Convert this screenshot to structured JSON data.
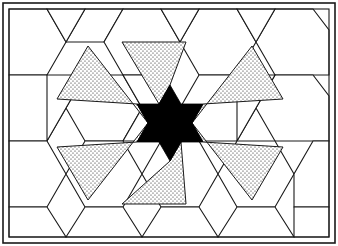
{
  "figure": {
    "kind": "line-drawing",
    "width": 338,
    "height": 246
  },
  "colors": {
    "background": "#ffffff",
    "line": "#1a1a1a",
    "core_fill": "#000000",
    "stipple_fill": "#ffffff",
    "stipple_dot": "#1a1a1a"
  },
  "frame": {
    "outer": {
      "x": 3,
      "y": 3,
      "width": 332,
      "height": 240
    },
    "inner": {
      "x": 9,
      "y": 9,
      "width": 320,
      "height": 228
    }
  },
  "geometry": {
    "center": {
      "x": 170,
      "y": 123
    },
    "core_star_points": 6,
    "core_outer_radius": 38,
    "core_inner_radius": 21,
    "ray_count": 6,
    "ray_tip_radius": 86,
    "grid": {
      "type": "hexagon-rhombus-tessellation",
      "hex_radius": 38,
      "angle_degrees": 60
    }
  },
  "elements": {
    "outer_frame": "outer-frame",
    "inner_frame": "inner-frame",
    "background_tiles": "hexagon-rhombus-tiling",
    "core_star": "black-hexagram",
    "rays": "stippled-star-points"
  },
  "core_star": {
    "points": "170,85 181,104 203,104 192,123 203,142 181,142 170,161 159,142 137,142 148,123 137,104 159,104"
  },
  "rays": [
    {
      "name": "ray-up",
      "points": "170,85 159,104 122,42 186,42"
    },
    {
      "name": "ray-upper-right",
      "points": "203,104 192,123 252,46 283,99"
    },
    {
      "name": "ray-lower-right",
      "points": "192,123 203,142 283,147 252,200"
    },
    {
      "name": "ray-down",
      "points": "170,161 181,142 186,204 122,204"
    },
    {
      "name": "ray-lower-left",
      "points": "137,142 148,123 88,200 57,147"
    },
    {
      "name": "ray-upper-left",
      "points": "148,123 137,104 57,99 88,46"
    }
  ],
  "tiles": [
    {
      "name": "hex-r0-c0",
      "points": "9,9 47,9 66,42 47,75 9,75"
    },
    {
      "name": "hex-r0-c1",
      "points": "66,42 104,42 123,9 85,9"
    },
    {
      "name": "hex-r0-c2",
      "points": "104,42 123,9 161,9 180,42 161,75 123,75"
    },
    {
      "name": "hex-r0-c3",
      "points": "180,42 199,9 237,9 256,42 237,75 199,75"
    },
    {
      "name": "hex-r0-c4",
      "points": "256,42 275,9 313,9 329,30 329,75 275,75"
    },
    {
      "name": "rhomb-a1",
      "points": "47,9 85,9 66,42"
    },
    {
      "name": "rhomb-a2",
      "points": "161,9 199,9 180,42"
    },
    {
      "name": "rhomb-a3",
      "points": "237,9 275,9 256,42"
    },
    {
      "name": "hex-r1-c0",
      "points": "9,75 47,75 66,108 47,141 9,141"
    },
    {
      "name": "hex-r1-c1",
      "points": "85,75 123,75 142,108 123,141 85,141 66,108"
    },
    {
      "name": "hex-r1-c2",
      "points": "199,75 237,75 256,108 237,141 199,141 180,108"
    },
    {
      "name": "hex-r1-c3",
      "points": "275,75 313,75 329,96 329,141 275,141 256,108"
    },
    {
      "name": "rhomb-b1",
      "points": "47,75 85,75 66,108 47,141"
    },
    {
      "name": "rhomb-b2",
      "points": "123,75 161,75 180,108 161,141 123,141 142,108"
    },
    {
      "name": "rhomb-b3",
      "points": "237,75 275,75 256,108 237,141"
    },
    {
      "name": "hex-r2-c0",
      "points": "9,141 47,141 66,174 47,207 9,207"
    },
    {
      "name": "hex-r2-c1",
      "points": "85,141 123,141 142,174 123,207 85,207 66,174"
    },
    {
      "name": "hex-r2-c2",
      "points": "161,141 199,141 218,174 199,207 161,207 142,174"
    },
    {
      "name": "hex-r2-c3",
      "points": "237,141 275,141 294,174 275,207 237,207 218,174"
    },
    {
      "name": "hex-r2-c4",
      "points": "313,141 329,141 329,207 294,207 294,174 313,141"
    },
    {
      "name": "hex-r3-c0",
      "points": "9,207 47,207 66,237 9,237"
    },
    {
      "name": "hex-r3-c1",
      "points": "66,237 85,207 123,207 142,237"
    },
    {
      "name": "hex-r3-c2",
      "points": "142,237 161,207 199,207 218,237"
    },
    {
      "name": "hex-r3-c3",
      "points": "218,237 237,207 275,207 294,237"
    },
    {
      "name": "hex-r3-c4",
      "points": "294,237 294,207 329,207 329,237"
    }
  ],
  "chart_data": {
    "type": "table",
    "xlabel": "",
    "ylabel": "",
    "categories": [
      "core-star",
      "stippled-rays",
      "background-hexagons",
      "background-rhombi"
    ],
    "values": [
      1,
      6,
      17,
      6
    ]
  }
}
